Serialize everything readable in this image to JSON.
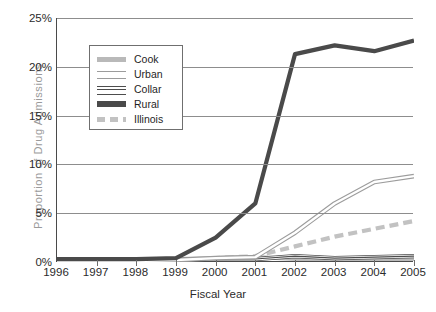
{
  "chart_data": {
    "type": "line",
    "title": "",
    "xlabel": "Fiscal Year",
    "ylabel": "Proportion of Drug Admissions",
    "categories": [
      "1996",
      "1997",
      "1998",
      "1999",
      "2000",
      "2001",
      "2002",
      "2003",
      "2004",
      "2005"
    ],
    "x": [
      1996,
      1997,
      1998,
      1999,
      2000,
      2001,
      2002,
      2003,
      2004,
      2005
    ],
    "xlim": [
      1996,
      2005
    ],
    "ylim": [
      0,
      25
    ],
    "yticks": [
      0,
      5,
      10,
      15,
      20,
      25
    ],
    "ytick_labels": [
      "0%",
      "5%",
      "10%",
      "15%",
      "20%",
      "25%"
    ],
    "grid": true,
    "legend_position": "upper-left-inset",
    "series": [
      {
        "name": "Cook",
        "color": "#b9b9b9",
        "style": "solid-thick",
        "values": [
          0.2,
          0.2,
          0.2,
          0.3,
          0.4,
          0.5,
          0.3,
          0.3,
          0.3,
          0.3
        ]
      },
      {
        "name": "Urban",
        "color": "#9c9c9c",
        "style": "outline-thin",
        "values": [
          0.1,
          0.1,
          0.1,
          0.2,
          0.4,
          0.5,
          3.0,
          6.0,
          8.2,
          8.8
        ]
      },
      {
        "name": "Collar",
        "color": "#4d4d4d",
        "style": "triple-thin",
        "values": [
          0.1,
          0.1,
          0.1,
          0.2,
          0.3,
          0.3,
          0.6,
          0.4,
          0.5,
          0.6
        ]
      },
      {
        "name": "Rural",
        "color": "#4a4a4a",
        "style": "solid-thick",
        "values": [
          0.3,
          0.3,
          0.3,
          0.4,
          2.5,
          6.0,
          21.3,
          22.2,
          21.6,
          22.7
        ]
      },
      {
        "name": "Illinois",
        "color": "#c2c2c2",
        "style": "dashed-thick",
        "values": [
          0.1,
          0.1,
          0.1,
          0.2,
          0.4,
          0.6,
          1.6,
          2.6,
          3.4,
          4.2
        ]
      }
    ]
  },
  "legend": {
    "items": [
      {
        "label": "Cook"
      },
      {
        "label": "Urban"
      },
      {
        "label": "Collar"
      },
      {
        "label": "Rural"
      },
      {
        "label": "Illinois"
      }
    ]
  }
}
